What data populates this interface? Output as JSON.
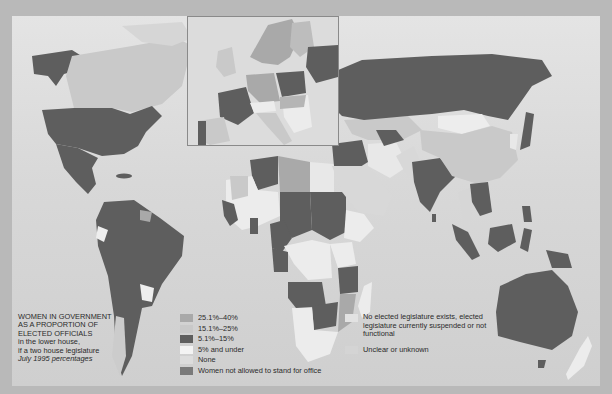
{
  "map": {
    "title": "Women in government as a proportion of elected officials",
    "legend_heading": {
      "line1": "WOMEN IN GOVERNMENT",
      "line2": "AS A PROPORTION OF",
      "line3": "ELECTED OFFICIALS",
      "line4": "in the lower house,",
      "line5": "if a two house legislature",
      "line6": "July 1995 percentages"
    },
    "legend": [
      {
        "label": "25.1%–40%",
        "color": "#a9a9a9"
      },
      {
        "label": "15.1%–25%",
        "color": "#c9c9c9"
      },
      {
        "label": "5.1%–15%",
        "color": "#5e5e5e"
      },
      {
        "label": "5% and under",
        "color": "#f3f3f3"
      },
      {
        "label": "None",
        "color": "#dcdcdc"
      },
      {
        "label": "Women not allowed to stand for office",
        "color": "#7a7a7a"
      },
      {
        "label": "No elected legislature exists, elected legislature currently suspended or not functional",
        "color": "#e2e2e2"
      },
      {
        "label": "Unclear or unknown",
        "color": "#d4d4d4"
      }
    ],
    "inset_label": "Europe",
    "colors": {
      "page_bg": "#b9b9b9",
      "ocean_top": "#e4e4e4",
      "ocean_bottom": "#cfcfcf",
      "dark": "#5e5e5e",
      "mid": "#a9a9a9",
      "light": "#c9c9c9",
      "pale": "#ededed"
    }
  }
}
